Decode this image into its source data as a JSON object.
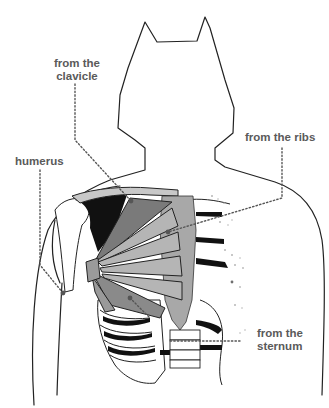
{
  "diagram": {
    "labels": {
      "clavicle": {
        "line1": "from the",
        "line2": "clavicle"
      },
      "humerus": {
        "line1": "humerus"
      },
      "ribs": {
        "line1": "from the ribs"
      },
      "sternum": {
        "line1": "from the",
        "line2": "sternum"
      }
    },
    "colors": {
      "label_text": "#5a5a5a",
      "outline": "#222222",
      "muscle_dark": "#7a7a7a",
      "muscle_mid": "#9a9a9a",
      "muscle_light": "#b5b5b5",
      "sternum": "#a8a8a8",
      "shadow": "#111111",
      "leader_line": "#555555"
    }
  }
}
